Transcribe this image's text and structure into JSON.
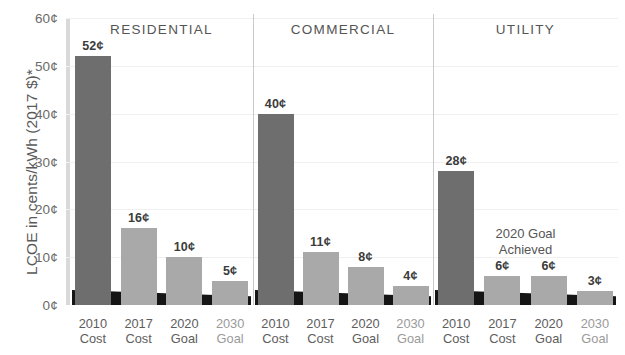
{
  "chart_data": {
    "type": "bar",
    "title": "",
    "subtitle": "",
    "xlabel": "",
    "ylabel": "LCOE in cents/kWh (2017 $)*",
    "ylim": [
      0,
      60
    ],
    "ytick_labels": [
      "60¢",
      "50¢",
      "40¢",
      "30¢",
      "20¢",
      "10¢",
      "0¢"
    ],
    "ytick_values": [
      60,
      50,
      40,
      30,
      20,
      10,
      0
    ],
    "grid": true,
    "legend": "none",
    "categories": [
      "2010 Cost",
      "2017 Cost",
      "2020 Goal",
      "2030 Goal"
    ],
    "panels": [
      {
        "name": "RESIDENTIAL",
        "values": [
          52,
          16,
          10,
          5
        ],
        "value_labels": [
          "52¢",
          "16¢",
          "10¢",
          "5¢"
        ],
        "bar_styles": [
          "dark",
          "light",
          "light",
          "light"
        ]
      },
      {
        "name": "COMMERCIAL",
        "values": [
          40,
          11,
          8,
          4
        ],
        "value_labels": [
          "40¢",
          "11¢",
          "8¢",
          "4¢"
        ],
        "bar_styles": [
          "dark",
          "light",
          "light",
          "light"
        ]
      },
      {
        "name": "UTILITY",
        "values": [
          28,
          6,
          6,
          3
        ],
        "value_labels": [
          "28¢",
          "6¢",
          "6¢",
          "3¢"
        ],
        "bar_styles": [
          "dark",
          "light",
          "light",
          "light"
        ],
        "annotation": {
          "line1": "2020 Goal",
          "line2": "Achieved",
          "over_categories": [
            "2017 Cost",
            "2020 Goal"
          ]
        }
      }
    ],
    "category_labels": [
      {
        "line1": "2010",
        "line2": "Cost",
        "dim": false
      },
      {
        "line1": "2017",
        "line2": "Cost",
        "dim": false
      },
      {
        "line1": "2020",
        "line2": "Goal",
        "dim": false
      },
      {
        "line1": "2030",
        "line2": "Goal",
        "dim": true
      }
    ],
    "colors": {
      "bar_dark": "#6e6e6e",
      "bar_light": "#a9a9a9",
      "baseline": "#151515",
      "axis": "#d9d9d9",
      "grid": "#f0f0f0",
      "divider": "#c9c9c9",
      "text": "#5a5a5a",
      "background": "#ffffff"
    }
  }
}
